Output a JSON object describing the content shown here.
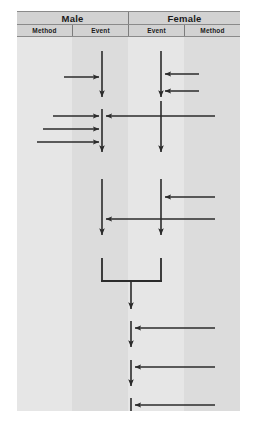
{
  "diagram": {
    "type": "swimlane-sequence-diagram",
    "title": "",
    "lanes": [
      {
        "group": "Male",
        "column": "Method",
        "x_range": [
          0,
          55
        ]
      },
      {
        "group": "Male",
        "column": "Event",
        "x_range": [
          55,
          111
        ]
      },
      {
        "group": "Female",
        "column": "Event",
        "x_range": [
          111,
          167
        ]
      },
      {
        "group": "Female",
        "column": "Method",
        "x_range": [
          167,
          223
        ]
      }
    ],
    "header": {
      "groups": [
        {
          "label": "Male",
          "span": 2
        },
        {
          "label": "Female",
          "span": 2
        }
      ],
      "columns": [
        {
          "label": "Method"
        },
        {
          "label": "Event"
        },
        {
          "label": "Event"
        },
        {
          "label": "Method"
        }
      ]
    },
    "colors": {
      "header_fill": "#d2d2d2",
      "header_border": "#8a8a8a",
      "body_fill": "#e3e3e3",
      "band_light": "#e6e6e6",
      "band_dark": "#dcdcdc",
      "stroke": "#2b2b2b"
    },
    "lifelines": [
      {
        "name": "male-event-lifeline",
        "x": 85,
        "segments": [
          [
            14,
            63
          ],
          [
            77,
            117
          ],
          [
            144,
            200
          ],
          [
            221,
            243
          ]
        ]
      },
      {
        "name": "female-event-lifeline",
        "x": 144,
        "segments": [
          [
            14,
            63
          ],
          [
            68,
            117
          ],
          [
            144,
            200
          ],
          [
            221,
            243
          ]
        ]
      },
      {
        "name": "merged-lifeline",
        "x": 114,
        "segments": [
          [
            244,
            274
          ],
          [
            290,
            320
          ],
          [
            345,
            375
          ]
        ]
      }
    ],
    "flows": [
      {
        "id": 1,
        "name": "male-method-to-event-1",
        "direction": "right",
        "y": 40,
        "from_x": 47,
        "to_x": 85
      },
      {
        "id": 2,
        "name": "female-method-to-event-1",
        "direction": "left",
        "y": 37,
        "from_x": 180,
        "to_x": 144
      },
      {
        "id": 3,
        "name": "female-method-to-event-2",
        "direction": "left",
        "y": 54,
        "from_x": 180,
        "to_x": 144
      },
      {
        "id": 4,
        "name": "male-method-to-event-2",
        "direction": "right",
        "y": 79,
        "from_x": 36,
        "to_x": 85
      },
      {
        "id": 5,
        "name": "female-event-to-male-event",
        "direction": "left",
        "y": 79,
        "from_x": 144,
        "to_x": 85
      },
      {
        "id": 6,
        "name": "male-method-to-event-3",
        "direction": "right",
        "y": 92,
        "from_x": 26,
        "to_x": 85
      },
      {
        "id": 7,
        "name": "male-method-to-event-4",
        "direction": "right",
        "y": 105,
        "from_x": 20,
        "to_x": 85
      },
      {
        "id": 8,
        "name": "female-method-to-event-3",
        "direction": "left",
        "y": 160,
        "from_x": 198,
        "to_x": 144
      },
      {
        "id": 9,
        "name": "female-method-to-male-event",
        "direction": "left",
        "y": 182,
        "from_x": 198,
        "to_x": 85
      },
      {
        "id": 10,
        "name": "merge-bar",
        "direction": "merge",
        "y": 244,
        "from_x": 85,
        "to_x": 144,
        "center_x": 114
      },
      {
        "id": 11,
        "name": "female-method-to-merged-1",
        "direction": "left",
        "y": 291,
        "from_x": 198,
        "to_x": 114
      },
      {
        "id": 12,
        "name": "female-method-to-merged-2",
        "direction": "left",
        "y": 330,
        "from_x": 198,
        "to_x": 114
      },
      {
        "id": 13,
        "name": "female-method-to-merged-3",
        "direction": "left",
        "y": 368,
        "from_x": 198,
        "to_x": 114
      }
    ]
  }
}
